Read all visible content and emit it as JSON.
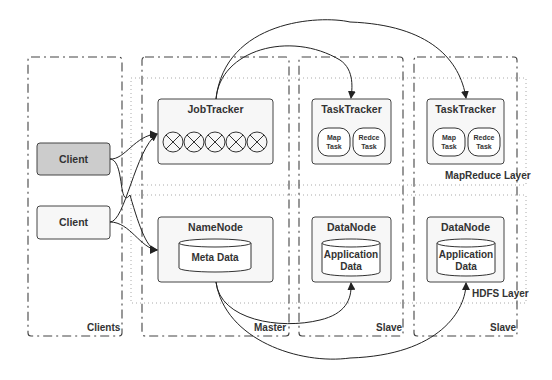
{
  "diagram": {
    "zones": [
      {
        "id": "clients",
        "label": "Clients"
      },
      {
        "id": "master",
        "label": "Master"
      },
      {
        "id": "slave1",
        "label": "Slave"
      },
      {
        "id": "slave2",
        "label": "Slave"
      }
    ],
    "layers": [
      {
        "id": "mapreduce",
        "label": "MapReduce Layer"
      },
      {
        "id": "hdfs",
        "label": "HDFS Layer"
      }
    ],
    "clients": [
      {
        "label": "Client",
        "highlighted": true
      },
      {
        "label": "Client",
        "highlighted": false
      }
    ],
    "master": {
      "jobtracker": {
        "title": "JobTracker",
        "slot_count": 5
      },
      "namenode": {
        "title": "NameNode",
        "store": "Meta Data"
      }
    },
    "slaves": [
      {
        "tasktracker": {
          "title": "TaskTracker",
          "tasks": [
            {
              "line1": "Map",
              "line2": "Task"
            },
            {
              "line1": "Redce",
              "line2": "Task"
            }
          ]
        },
        "datanode": {
          "title": "DataNode",
          "store_line1": "Application",
          "store_line2": "Data"
        }
      },
      {
        "tasktracker": {
          "title": "TaskTracker",
          "tasks": [
            {
              "line1": "Map",
              "line2": "Task"
            },
            {
              "line1": "Redce",
              "line2": "Task"
            }
          ]
        },
        "datanode": {
          "title": "DataNode",
          "store_line1": "Application",
          "store_line2": "Data"
        }
      }
    ],
    "colors": {
      "stroke": "#333333",
      "node_fill": "#f7f7f7",
      "client_highlight_fill": "#cccccc",
      "layer_border": "#aaaaaa"
    }
  }
}
